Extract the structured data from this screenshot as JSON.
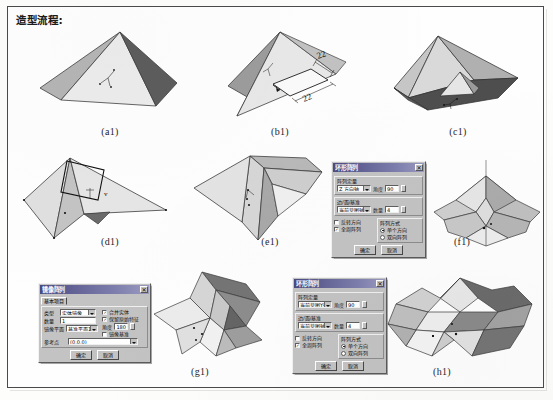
{
  "page": {
    "heading": "造型流程:"
  },
  "figures": [
    {
      "id": "a1",
      "label": "(a1)",
      "desc": "square-pyramid-shaded"
    },
    {
      "id": "b1",
      "label": "(b1)",
      "desc": "pyramid-with-rectangle-sketch",
      "dimensions": [
        {
          "text": "22"
        },
        {
          "text": "22"
        }
      ]
    },
    {
      "id": "c1",
      "label": "(c1)",
      "desc": "pyramid-with-cut-notch"
    },
    {
      "id": "d1",
      "label": "(d1)",
      "desc": "folded-pyramid-with-sketch-plane"
    },
    {
      "id": "e1",
      "label": "(e1)",
      "desc": "folded-pyramid-extruded"
    },
    {
      "id": "f1",
      "label": "(f1)",
      "desc": "polar-array-result-star"
    },
    {
      "id": "g1",
      "label": "(g1)",
      "desc": "mirrored-star-form"
    },
    {
      "id": "h1",
      "label": "(h1)",
      "desc": "final-star-polygon-form"
    }
  ],
  "dialogs": {
    "polar_array_f1": {
      "title": "环形阵列",
      "close_label": "✕",
      "group_direction": {
        "legend": "阵列定量",
        "field_label": "旋转轴",
        "field_value": "Z 方向轴",
        "angle_label": "角度",
        "angle_value": "90"
      },
      "group_axis": {
        "legend": "边/面/基准",
        "field_value": "当前草图轴",
        "count_label": "数量",
        "count_value": "4"
      },
      "checkboxes": [
        {
          "label": "反转方向",
          "checked": false
        },
        {
          "label": "全周阵列",
          "checked": true
        }
      ],
      "group_type": {
        "legend": "阵列方式",
        "options": [
          {
            "label": "单个方向",
            "selected": true
          },
          {
            "label": "双向阵列",
            "selected": false
          }
        ]
      },
      "buttons": [
        {
          "label": "确定"
        },
        {
          "label": "取消"
        }
      ]
    },
    "mirror_g1": {
      "title": "镜像阵列",
      "close_label": "✕",
      "tab_label": "基本项目",
      "fields": [
        {
          "label": "类型",
          "value": "实体镜像"
        },
        {
          "label": "数量",
          "value": "1"
        },
        {
          "label": "镜像平面",
          "value": "基准平面1"
        },
        {
          "label": "参考点",
          "value": "(0,0,0)"
        }
      ],
      "angle_label": "角度",
      "angle_value": "180",
      "checkboxes": [
        {
          "label": "合并实体",
          "checked": true
        },
        {
          "label": "保留原始特征",
          "checked": true
        },
        {
          "label": "镜像基准",
          "checked": false
        }
      ],
      "buttons": [
        {
          "label": "确定"
        },
        {
          "label": "取消"
        }
      ]
    },
    "polar_array_h1": {
      "title": "环形阵列",
      "close_label": "✕",
      "group_direction": {
        "legend": "阵列定量",
        "field_label": "旋转轴",
        "field_value": "当前草图Y轴",
        "angle_label": "角度",
        "angle_value": "90"
      },
      "group_axis": {
        "legend": "边/面/基准",
        "field_value": "当前草图轴",
        "count_label": "数量",
        "count_value": "4"
      },
      "checkboxes": [
        {
          "label": "反转方向",
          "checked": false
        },
        {
          "label": "全周阵列",
          "checked": true
        }
      ],
      "group_type": {
        "legend": "阵列方式",
        "options": [
          {
            "label": "单个方向",
            "selected": true
          },
          {
            "label": "双向阵列",
            "selected": false
          }
        ]
      },
      "buttons": [
        {
          "label": "确定"
        },
        {
          "label": "取消"
        }
      ]
    }
  },
  "colors": {
    "face_light": "#e2e2e2",
    "face_mid": "#b8b8b8",
    "face_dark": "#6f6f6f",
    "face_darker": "#4a4a4a",
    "outline": "#3a3a3a",
    "frame": "#4a4a4a",
    "dialog_titlebar": "#4b4b82"
  }
}
